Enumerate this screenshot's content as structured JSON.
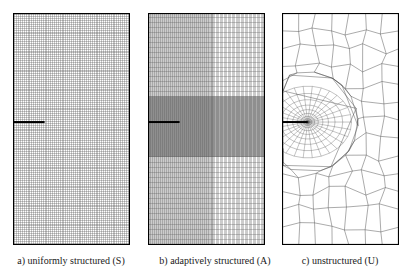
{
  "figure": {
    "name": "finite-element-mesh-comparison",
    "background_color": "#ffffff",
    "width": 411,
    "height": 280
  },
  "panels": [
    {
      "id": "a",
      "caption": "a) uniformly structured (S)",
      "mesh_type": "uniformly structured",
      "mesh_code": "S",
      "x": 13,
      "y": 13,
      "width": 117,
      "height": 232,
      "border_color": "#000000",
      "line_color": "#555555",
      "crack": {
        "label": "crack",
        "color": "#000000",
        "x_start": 0.0,
        "x_end": 0.27,
        "y": 0.47,
        "thickness": 2.0
      },
      "grid": {
        "columns": 62,
        "rows": 122,
        "uniform": true
      }
    },
    {
      "id": "b",
      "caption": "b) adaptively structured (A)",
      "mesh_type": "adaptively structured",
      "mesh_code": "A",
      "x": 148,
      "y": 13,
      "width": 117,
      "height": 232,
      "border_color": "#000000",
      "line_color": "#555555",
      "crack": {
        "label": "crack",
        "color": "#000000",
        "x_start": 0.0,
        "x_end": 0.27,
        "y": 0.47,
        "thickness": 2.0
      },
      "grid": {
        "uniform": false,
        "refinement_center_x": 0.27,
        "refinement_center_y": 0.47,
        "columns_dense": 96,
        "columns_coarse": 40,
        "split_x": 0.55,
        "rows_dense": 120,
        "rows_coarse": 46,
        "split_y_top": 0.36,
        "split_y_bottom": 0.62
      }
    },
    {
      "id": "c",
      "caption": "c) unstructured (U)",
      "mesh_type": "unstructured",
      "mesh_code": "U",
      "x": 282,
      "y": 13,
      "width": 117,
      "height": 232,
      "border_color": "#000000",
      "line_color": "#444444",
      "crack": {
        "label": "crack",
        "color": "#000000",
        "x_start": 0.0,
        "x_end": 0.22,
        "y": 0.47,
        "thickness": 2.0
      },
      "grid": {
        "uniform": false,
        "type": "unstructured-quad",
        "rosette_center_x": 0.22,
        "rosette_center_y": 0.47,
        "rosette_radius": 0.17,
        "rosette_rings": 11,
        "rosette_sectors": 30,
        "coarse_columns": 7,
        "coarse_rows": 13
      }
    }
  ]
}
